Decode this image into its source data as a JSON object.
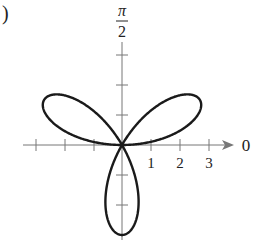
{
  "figure": {
    "corner_label": ")",
    "angle_label_top": {
      "numerator": "π",
      "denominator": "2"
    },
    "polar_axis_label": "0",
    "tick_labels": [
      "1",
      "2",
      "3"
    ]
  },
  "chart_data": {
    "type": "line",
    "subtype": "polar",
    "title": "",
    "equation_shape": "three-petal rose curve r = 3 sin(3θ)",
    "curve": {
      "petals": 3,
      "amplitude": 3,
      "petal_angles_deg": [
        30,
        150,
        270
      ]
    },
    "polar_axis": {
      "label": "0",
      "ticks": [
        1,
        2,
        3
      ],
      "range": [
        -3.2,
        3.8
      ]
    },
    "vertical_axis": {
      "label": "π/2",
      "ticks": [
        -3,
        -2,
        -1,
        1,
        2,
        3
      ]
    },
    "grid": false,
    "legend": null
  },
  "colors": {
    "curve": "#1a1a1a",
    "axis": "#777777",
    "text": "#222222"
  }
}
